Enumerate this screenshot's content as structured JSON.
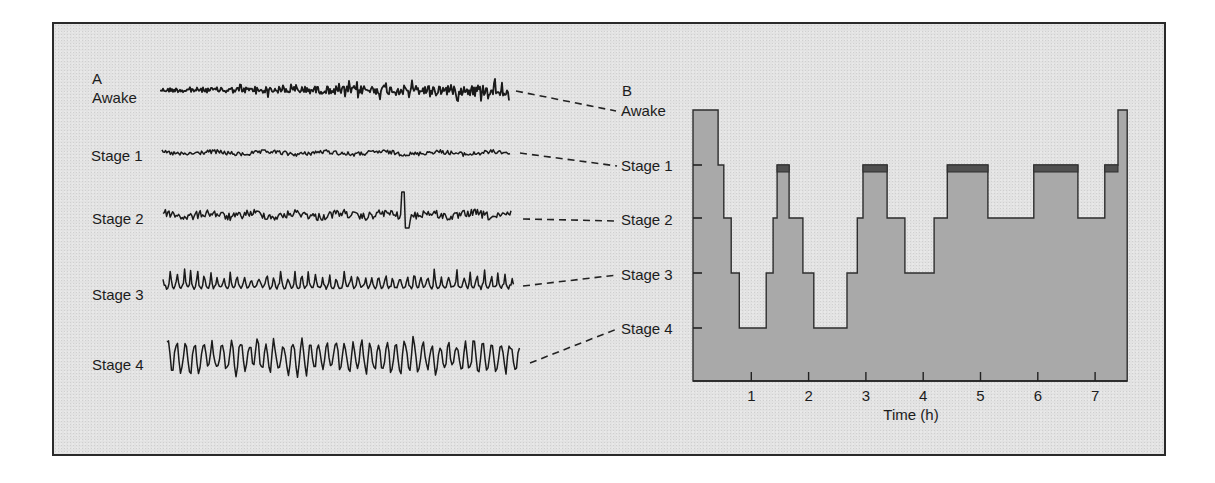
{
  "figure": {
    "panel_a_label": "A",
    "panel_b_label": "B",
    "colors": {
      "background": "#e2e2e2",
      "frame": "#2a2a2a",
      "trace": "#1a1a1a",
      "hypnogram_fill": "#a9a9a9",
      "hypnogram_outline": "#2e2e2e",
      "rem_band": "#505050"
    }
  },
  "panel_a": {
    "title": "A",
    "traces": [
      {
        "label": "Awake",
        "label_x": 92,
        "label_y": 103,
        "x0": 160,
        "x1": 509,
        "cy": 90,
        "amp": 4.5,
        "period": 3.2,
        "grow": 1.5,
        "style": "fast",
        "connector": [
          516,
          91,
          616,
          111
        ]
      },
      {
        "label": "Stage 1",
        "label_x": 91,
        "label_y": 161,
        "x0": 162,
        "x1": 510,
        "cy": 153,
        "amp": 2.2,
        "period": 6,
        "grow": 1.0,
        "style": "low",
        "connector": [
          520,
          153,
          617,
          166
        ]
      },
      {
        "label": "Stage 2",
        "label_x": 92,
        "label_y": 224,
        "x0": 163,
        "x1": 512,
        "cy": 215,
        "amp": 4,
        "period": 5,
        "grow": 1.0,
        "style": "spindle",
        "connector": [
          523,
          219,
          617,
          221
        ]
      },
      {
        "label": "Stage 3",
        "label_x": 92,
        "label_y": 300,
        "x0": 163,
        "x1": 514,
        "cy": 285,
        "amp": 7,
        "period": 7,
        "grow": 1.0,
        "style": "slow",
        "connector": [
          523,
          286,
          617,
          275
        ]
      },
      {
        "label": "Stage 4",
        "label_x": 92,
        "label_y": 370,
        "x0": 167,
        "x1": 520,
        "cy": 357,
        "amp": 15,
        "period": 9,
        "grow": 1.0,
        "style": "delta",
        "connector": [
          530,
          363,
          617,
          329
        ]
      }
    ]
  },
  "panel_b": {
    "title": "B",
    "y_labels": [
      {
        "label": "Awake",
        "y": 116
      },
      {
        "label": "Stage 1",
        "y": 171
      },
      {
        "label": "Stage 2",
        "y": 225
      },
      {
        "label": "Stage 3",
        "y": 280
      },
      {
        "label": "Stage 4",
        "y": 334
      }
    ],
    "x_axis_title": "Time (h)",
    "x_ticks": [
      "1",
      "2",
      "3",
      "4",
      "5",
      "6",
      "7"
    ]
  },
  "chart_data": {
    "type": "step-area (hypnogram)",
    "xlabel": "Time (h)",
    "ylabel": "",
    "x_ticks": [
      1,
      2,
      3,
      4,
      5,
      6,
      7
    ],
    "xlim": [
      0,
      7.56
    ],
    "y_categories": [
      "Awake",
      "Stage 1",
      "Stage 2",
      "Stage 3",
      "Stage 4"
    ],
    "rem_marker": "dark band on Stage 1 segments after sleep onset (REM)",
    "segments": [
      {
        "start": 0.0,
        "end": 0.42,
        "stage": "Awake"
      },
      {
        "start": 0.42,
        "end": 0.52,
        "stage": "Stage 1"
      },
      {
        "start": 0.52,
        "end": 0.65,
        "stage": "Stage 2"
      },
      {
        "start": 0.65,
        "end": 0.79,
        "stage": "Stage 3"
      },
      {
        "start": 0.79,
        "end": 1.26,
        "stage": "Stage 4"
      },
      {
        "start": 1.26,
        "end": 1.38,
        "stage": "Stage 3"
      },
      {
        "start": 1.38,
        "end": 1.45,
        "stage": "Stage 2"
      },
      {
        "start": 1.45,
        "end": 1.66,
        "stage": "Stage 1",
        "rem": true
      },
      {
        "start": 1.66,
        "end": 1.9,
        "stage": "Stage 2"
      },
      {
        "start": 1.9,
        "end": 2.09,
        "stage": "Stage 3"
      },
      {
        "start": 2.09,
        "end": 2.67,
        "stage": "Stage 4"
      },
      {
        "start": 2.67,
        "end": 2.85,
        "stage": "Stage 3"
      },
      {
        "start": 2.85,
        "end": 2.95,
        "stage": "Stage 2"
      },
      {
        "start": 2.95,
        "end": 3.37,
        "stage": "Stage 1",
        "rem": true
      },
      {
        "start": 3.37,
        "end": 3.68,
        "stage": "Stage 2"
      },
      {
        "start": 3.68,
        "end": 4.19,
        "stage": "Stage 3"
      },
      {
        "start": 4.19,
        "end": 4.42,
        "stage": "Stage 2"
      },
      {
        "start": 4.42,
        "end": 5.13,
        "stage": "Stage 1",
        "rem": true
      },
      {
        "start": 5.13,
        "end": 5.93,
        "stage": "Stage 2"
      },
      {
        "start": 5.93,
        "end": 6.7,
        "stage": "Stage 1",
        "rem": true
      },
      {
        "start": 6.7,
        "end": 7.17,
        "stage": "Stage 2"
      },
      {
        "start": 7.17,
        "end": 7.4,
        "stage": "Stage 1",
        "rem": true
      },
      {
        "start": 7.4,
        "end": 7.56,
        "stage": "Awake"
      }
    ],
    "grid": false,
    "legend": null
  }
}
